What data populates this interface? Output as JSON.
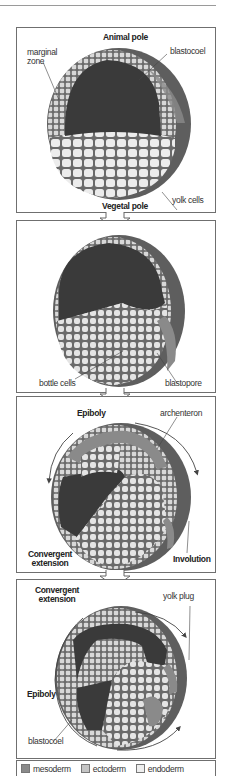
{
  "colors": {
    "mesoderm": "#8a8a8a",
    "ectoderm": "#c4c4c4",
    "endoderm": "#eeeeee",
    "cavity": "#3a3a3a",
    "outer_shell": "#5e5e5e",
    "cell_outline": "#6a6a6a",
    "panel_border": "#6f6f6f"
  },
  "panels": [
    {
      "stage": 1,
      "labels": {
        "top": "Animal pole",
        "marginal_zone": "marginal zone",
        "blastocoel": "blastocoel",
        "yolk_cells": "yolk cells",
        "bottom": "Vegetal pole"
      }
    },
    {
      "stage": 2,
      "labels": {
        "bottle_cells": "bottle cells",
        "blastopore": "blastopore"
      }
    },
    {
      "stage": 3,
      "labels": {
        "epiboly": "Epiboly",
        "archenteron": "archenteron",
        "convergent_extension": "Convergent extension",
        "involution": "Involution"
      }
    },
    {
      "stage": 4,
      "labels": {
        "convergent_extension": "Convergent extension",
        "yolk_plug": "yolk plug",
        "epiboly": "Epiboly",
        "blastocoel": "blastocoel"
      }
    }
  ],
  "legend": [
    {
      "label": "mesoderm",
      "swatch": "#8a8a8a"
    },
    {
      "label": "ectoderm",
      "swatch": "#c4c4c4"
    },
    {
      "label": "endoderm",
      "swatch": "#eeeeee"
    }
  ],
  "arrow_icon": "down-arrow-outline"
}
